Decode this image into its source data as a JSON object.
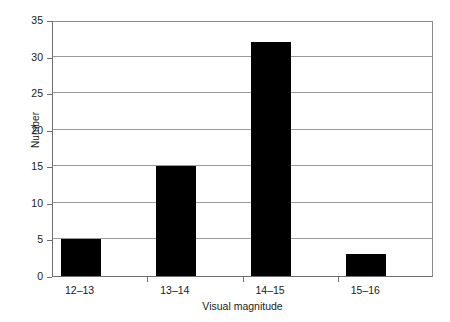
{
  "chart_data": {
    "type": "bar",
    "title": "",
    "subtitle": "",
    "categories": [
      "12–13",
      "13–14",
      "14–15",
      "15–16"
    ],
    "values": [
      5,
      15,
      32,
      3
    ],
    "xlabel": "Visual magnitude",
    "ylabel": "Number",
    "ylim": [
      0,
      35
    ],
    "ytick_labels": [
      "0",
      "5",
      "10",
      "15",
      "20",
      "25",
      "30",
      "35"
    ],
    "ytick_values": [
      0,
      5,
      10,
      15,
      20,
      25,
      30,
      35
    ],
    "grid": "horizontal",
    "legend": "none",
    "bar_color": "#000000",
    "gridline_color": "#9a9a9a",
    "axis_color": "#6e6e6e",
    "background_color": "#ffffff",
    "annotations": []
  }
}
